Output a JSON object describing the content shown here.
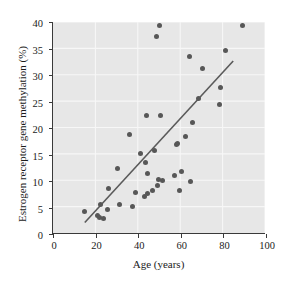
{
  "chart_data": {
    "type": "scatter",
    "title": "",
    "xlabel": "Age (years)",
    "ylabel": "Estrogen receptor gene methylation (%)",
    "xlim": [
      0,
      100
    ],
    "ylim": [
      0,
      40
    ],
    "xticks": [
      0,
      20,
      40,
      60,
      80,
      100
    ],
    "yticks": [
      0,
      5,
      10,
      15,
      20,
      25,
      30,
      35,
      40
    ],
    "grid": true,
    "grid_color": "#f7f7f7",
    "plot_background": "#e7e7e7",
    "point_color": "#575757",
    "line_color": "#5a5a5a",
    "legend": null,
    "series": [
      {
        "name": "Subjects",
        "points": [
          [
            15.0,
            4.2
          ],
          [
            21.0,
            3.4
          ],
          [
            22.0,
            3.1
          ],
          [
            22.5,
            5.5
          ],
          [
            23.5,
            2.9
          ],
          [
            25.5,
            4.6
          ],
          [
            26.0,
            8.6
          ],
          [
            30.5,
            12.4
          ],
          [
            31.0,
            5.5
          ],
          [
            36.0,
            18.8
          ],
          [
            37.5,
            5.2
          ],
          [
            38.5,
            7.9
          ],
          [
            41.0,
            15.1
          ],
          [
            43.0,
            7.1
          ],
          [
            43.5,
            13.4
          ],
          [
            44.0,
            22.3
          ],
          [
            44.5,
            11.4
          ],
          [
            44.5,
            7.6
          ],
          [
            46.5,
            8.3
          ],
          [
            47.5,
            15.8
          ],
          [
            48.5,
            37.2
          ],
          [
            49.0,
            9.2
          ],
          [
            49.5,
            10.2
          ],
          [
            50.0,
            39.3
          ],
          [
            50.5,
            22.4
          ],
          [
            51.5,
            10.1
          ],
          [
            57.0,
            11.1
          ],
          [
            58.0,
            16.9
          ],
          [
            58.5,
            17.1
          ],
          [
            59.5,
            8.2
          ],
          [
            60.5,
            11.8
          ],
          [
            62.0,
            18.4
          ],
          [
            64.0,
            33.5
          ],
          [
            64.5,
            9.9
          ],
          [
            65.5,
            21.0
          ],
          [
            68.5,
            25.6
          ],
          [
            70.0,
            31.3
          ],
          [
            78.0,
            24.5
          ],
          [
            78.5,
            27.6
          ],
          [
            81.0,
            34.6
          ],
          [
            89.0,
            39.3
          ]
        ]
      }
    ],
    "trendline": {
      "name": "Least-squares regression line",
      "x_start": 15.0,
      "y_start": 2.0,
      "x_end": 85.0,
      "y_end": 32.6
    }
  }
}
